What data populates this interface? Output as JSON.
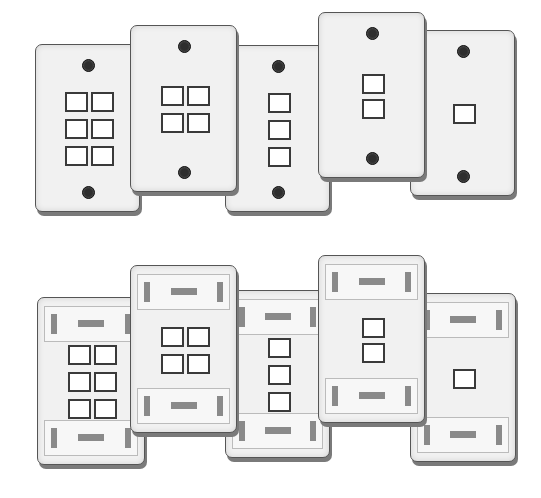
{
  "illustration": {
    "subject": "wall plates",
    "background_color": "#ffffff",
    "plate_color": "#f1f1f1",
    "port_border_color": "#3a3a3a",
    "rows": [
      {
        "style": "screw-mount",
        "plates": [
          {
            "ports": 6,
            "layout": "2x3",
            "x": 35,
            "y": 44,
            "w": 105,
            "h": 168
          },
          {
            "ports": 4,
            "layout": "2x2",
            "x": 130,
            "y": 25,
            "w": 107,
            "h": 167
          },
          {
            "ports": 3,
            "layout": "1x3",
            "x": 225,
            "y": 45,
            "w": 105,
            "h": 167
          },
          {
            "ports": 2,
            "layout": "1x2",
            "x": 318,
            "y": 12,
            "w": 107,
            "h": 166
          },
          {
            "ports": 1,
            "layout": "1x1",
            "x": 410,
            "y": 30,
            "w": 105,
            "h": 166
          }
        ]
      },
      {
        "style": "label-window",
        "plates": [
          {
            "ports": 6,
            "layout": "2x3",
            "x": 37,
            "y": 297,
            "w": 108,
            "h": 168
          },
          {
            "ports": 4,
            "layout": "2x2",
            "x": 130,
            "y": 265,
            "w": 107,
            "h": 168
          },
          {
            "ports": 3,
            "layout": "1x3",
            "x": 225,
            "y": 290,
            "w": 105,
            "h": 168
          },
          {
            "ports": 2,
            "layout": "1x2",
            "x": 318,
            "y": 255,
            "w": 107,
            "h": 168
          },
          {
            "ports": 1,
            "layout": "1x1",
            "x": 410,
            "y": 293,
            "w": 106,
            "h": 169
          }
        ]
      }
    ]
  }
}
